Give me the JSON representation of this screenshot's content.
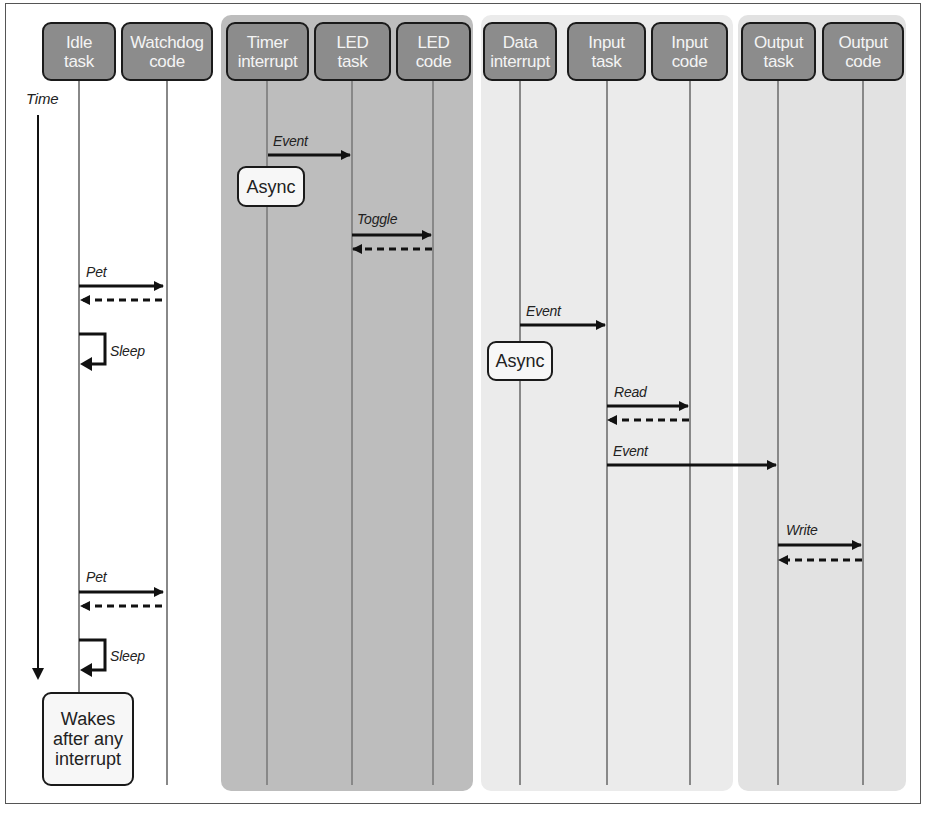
{
  "diagram": {
    "type": "sequence-diagram",
    "time_axis_label": "Time",
    "groups": [
      {
        "name": "main-group",
        "participants": [
          "Idle task",
          "Watchdog code"
        ],
        "background": "#ffffff"
      },
      {
        "name": "timer-group",
        "participants": [
          "Timer interrupt",
          "LED task",
          "LED code"
        ],
        "background": "#bdbdbd"
      },
      {
        "name": "data-group",
        "participants": [
          "Data interrupt",
          "Input task",
          "Input code"
        ],
        "background": "#ebebeb"
      },
      {
        "name": "output-group",
        "participants": [
          "Output task",
          "Output code"
        ],
        "background": "#e2e2e2"
      }
    ],
    "participants": [
      {
        "id": "idle",
        "label": "Idle\ntask"
      },
      {
        "id": "watchdog",
        "label": "Watchdog\ncode"
      },
      {
        "id": "timer",
        "label": "Timer\ninterrupt"
      },
      {
        "id": "led_task",
        "label": "LED\ntask"
      },
      {
        "id": "led_code",
        "label": "LED\ncode"
      },
      {
        "id": "data",
        "label": "Data\ninterrupt"
      },
      {
        "id": "input_task",
        "label": "Input\ntask"
      },
      {
        "id": "input_code",
        "label": "Input\ncode"
      },
      {
        "id": "output_task",
        "label": "Output\ntask"
      },
      {
        "id": "output_code",
        "label": "Output\ncode"
      }
    ],
    "messages": [
      {
        "from": "timer",
        "to": "led_task",
        "label": "Event",
        "style": "solid"
      },
      {
        "from": "led_task",
        "to": "led_code",
        "label": "Toggle",
        "style": "solid",
        "return": true
      },
      {
        "from": "idle",
        "to": "watchdog",
        "label": "Pet",
        "style": "solid",
        "return": true
      },
      {
        "from": "idle",
        "to": "idle",
        "label": "Sleep",
        "style": "self"
      },
      {
        "from": "data",
        "to": "input_task",
        "label": "Event",
        "style": "solid"
      },
      {
        "from": "input_task",
        "to": "input_code",
        "label": "Read",
        "style": "solid",
        "return": true
      },
      {
        "from": "input_task",
        "to": "output_task",
        "label": "Event",
        "style": "solid"
      },
      {
        "from": "output_task",
        "to": "output_code",
        "label": "Write",
        "style": "solid",
        "return": true
      },
      {
        "from": "idle",
        "to": "watchdog",
        "label": "Pet",
        "style": "solid",
        "return": true
      },
      {
        "from": "idle",
        "to": "idle",
        "label": "Sleep",
        "style": "self"
      }
    ],
    "notes": [
      {
        "on": "timer",
        "text": "Async"
      },
      {
        "on": "data",
        "text": "Async"
      },
      {
        "on": "idle",
        "text": "Wakes\nafter any\ninterrupt"
      }
    ]
  },
  "labels": {
    "time": "Time",
    "event1": "Event",
    "toggle": "Toggle",
    "pet1": "Pet",
    "sleep1": "Sleep",
    "event2": "Event",
    "read": "Read",
    "event3": "Event",
    "write": "Write",
    "pet2": "Pet",
    "sleep2": "Sleep",
    "async1": "Async",
    "async2": "Async",
    "wakes": "Wakes\nafter any\ninterrupt"
  },
  "headers": {
    "idle": "Idle\ntask",
    "watchdog": "Watchdog\ncode",
    "timer": "Timer\ninterrupt",
    "led_task": "LED\ntask",
    "led_code": "LED\ncode",
    "data": "Data\ninterrupt",
    "input_task": "Input\ntask",
    "input_code": "Input\ncode",
    "output_task": "Output\ntask",
    "output_code": "Output\ncode"
  }
}
